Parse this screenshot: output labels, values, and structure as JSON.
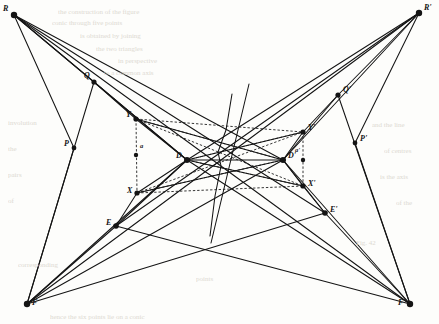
{
  "figure": {
    "type": "geometric-construction-diagram",
    "background_color": "#fdfdfb",
    "ink_color": "#141414",
    "width": 439,
    "height": 324
  },
  "points": [
    {
      "id": "R",
      "label": "R",
      "x": 14,
      "y": 15,
      "label_dx": -11,
      "label_dy": -4,
      "dot": 3.2
    },
    {
      "id": "Rp",
      "label": "R'",
      "x": 419,
      "y": 13,
      "label_dx": 5,
      "label_dy": -3,
      "dot": 3.2
    },
    {
      "id": "F",
      "label": "F",
      "x": 27,
      "y": 304,
      "label_dx": 5,
      "label_dy": 1,
      "dot": 3.2
    },
    {
      "id": "Fp",
      "label": "F'",
      "x": 410,
      "y": 304,
      "label_dx": -12,
      "label_dy": 1,
      "dot": 3.2
    },
    {
      "id": "Q",
      "label": "Q",
      "x": 94,
      "y": 82,
      "label_dx": -10,
      "label_dy": -4,
      "dot": 2.6
    },
    {
      "id": "Qp",
      "label": "Q'",
      "x": 338,
      "y": 95,
      "label_dx": 5,
      "label_dy": -3,
      "dot": 2.6
    },
    {
      "id": "P",
      "label": "P",
      "x": 74,
      "y": 148,
      "label_dx": -10,
      "label_dy": -2,
      "dot": 2.4
    },
    {
      "id": "Pp",
      "label": "P'",
      "x": 355,
      "y": 143,
      "label_dx": 5,
      "label_dy": -2,
      "dot": 2.4
    },
    {
      "id": "E",
      "label": "E",
      "x": 116,
      "y": 226,
      "label_dx": -10,
      "label_dy": -1,
      "dot": 2.8
    },
    {
      "id": "Ep",
      "label": "E'",
      "x": 325,
      "y": 213,
      "label_dx": 5,
      "label_dy": -1,
      "dot": 2.8
    },
    {
      "id": "D",
      "label": "D",
      "x": 187,
      "y": 160,
      "label_dx": -11,
      "label_dy": -2,
      "dot": 3.0
    },
    {
      "id": "Dp",
      "label": "D'",
      "x": 283,
      "y": 160,
      "label_dx": 5,
      "label_dy": -2,
      "dot": 3.0
    },
    {
      "id": "Y",
      "label": "Y",
      "x": 136,
      "y": 119,
      "label_dx": -10,
      "label_dy": -2,
      "dot": 2.6
    },
    {
      "id": "Yp",
      "label": "Y'",
      "x": 303,
      "y": 132,
      "label_dx": 5,
      "label_dy": -2,
      "dot": 2.6
    },
    {
      "id": "X",
      "label": "X",
      "x": 137,
      "y": 193,
      "label_dx": -10,
      "label_dy": 0,
      "dot": 2.6
    },
    {
      "id": "Xp",
      "label": "X'",
      "x": 303,
      "y": 186,
      "label_dx": 5,
      "label_dy": 0,
      "dot": 2.6
    },
    {
      "id": "a",
      "label": "a",
      "x": 136,
      "y": 155,
      "label_dx": 4,
      "label_dy": -6,
      "dot": 2.2
    },
    {
      "id": "ap",
      "label": "a'",
      "x": 303,
      "y": 160,
      "label_dx": -8,
      "label_dy": -7,
      "dot": 2.2
    }
  ],
  "solid_edges": [
    [
      "R",
      "Q"
    ],
    [
      "R",
      "P"
    ],
    [
      "R",
      "D"
    ],
    [
      "R",
      "Dp"
    ],
    [
      "R",
      "Ep"
    ],
    [
      "R",
      "Fp"
    ],
    [
      "Rp",
      "Qp"
    ],
    [
      "Rp",
      "Pp"
    ],
    [
      "Rp",
      "Dp"
    ],
    [
      "Rp",
      "D"
    ],
    [
      "Rp",
      "E"
    ],
    [
      "Rp",
      "F"
    ],
    [
      "F",
      "E"
    ],
    [
      "F",
      "P"
    ],
    [
      "F",
      "Q"
    ],
    [
      "F",
      "D"
    ],
    [
      "F",
      "Dp"
    ],
    [
      "F",
      "Ep"
    ],
    [
      "Fp",
      "Ep"
    ],
    [
      "Fp",
      "Pp"
    ],
    [
      "Fp",
      "Qp"
    ],
    [
      "Fp",
      "Dp"
    ],
    [
      "Fp",
      "D"
    ],
    [
      "Fp",
      "E"
    ],
    [
      "Q",
      "Y"
    ],
    [
      "Q",
      "D"
    ],
    [
      "Qp",
      "Yp"
    ],
    [
      "Qp",
      "Dp"
    ],
    [
      "E",
      "X"
    ],
    [
      "E",
      "D"
    ],
    [
      "Ep",
      "Xp"
    ],
    [
      "Ep",
      "Dp"
    ],
    [
      "D",
      "Y"
    ],
    [
      "D",
      "X"
    ],
    [
      "Dp",
      "Yp"
    ],
    [
      "Dp",
      "Xp"
    ],
    [
      "D",
      "Dp"
    ],
    [
      "D",
      "Yp"
    ],
    [
      "D",
      "Xp"
    ],
    [
      "Dp",
      "Y"
    ],
    [
      "Dp",
      "X"
    ]
  ],
  "dashed_edges": [
    [
      "Y",
      "X"
    ],
    [
      "Yp",
      "Xp"
    ],
    [
      "Y",
      "Yp"
    ],
    [
      "X",
      "Xp"
    ],
    [
      "Y",
      "Xp"
    ],
    [
      "X",
      "Yp"
    ],
    [
      "Y",
      "Dp"
    ],
    [
      "X",
      "Dp"
    ],
    [
      "Yp",
      "D"
    ],
    [
      "Xp",
      "D"
    ]
  ],
  "extra_lines": [
    {
      "name": "steep-axis-line",
      "x1": 249,
      "y1": 84,
      "x2": 211,
      "y2": 243
    },
    {
      "name": "curved-median-line",
      "points": "232,94 226,130 218,152 221,166 215,196 210,236"
    }
  ],
  "bleed_text": [
    {
      "text": "the construction of the figure",
      "x": 58,
      "y": 9,
      "size": 7
    },
    {
      "text": "conic through five points",
      "x": 52,
      "y": 20,
      "size": 7
    },
    {
      "text": "is obtained by joining",
      "x": 80,
      "y": 33,
      "size": 7
    },
    {
      "text": "the two triangles",
      "x": 96,
      "y": 46,
      "size": 7
    },
    {
      "text": "in perspective",
      "x": 118,
      "y": 58,
      "size": 7
    },
    {
      "text": "to a common axis",
      "x": 104,
      "y": 70,
      "size": 7
    },
    {
      "text": "involution",
      "x": 8,
      "y": 120,
      "size": 7
    },
    {
      "text": "the",
      "x": 8,
      "y": 146,
      "size": 7
    },
    {
      "text": "pairs",
      "x": 8,
      "y": 172,
      "size": 7
    },
    {
      "text": "of",
      "x": 8,
      "y": 198,
      "size": 7
    },
    {
      "text": "corresponding",
      "x": 18,
      "y": 262,
      "size": 7
    },
    {
      "text": "points",
      "x": 196,
      "y": 276,
      "size": 7
    },
    {
      "text": "Fig. 42",
      "x": 356,
      "y": 240,
      "size": 7
    },
    {
      "text": "and the line",
      "x": 372,
      "y": 122,
      "size": 7
    },
    {
      "text": "of centres",
      "x": 384,
      "y": 148,
      "size": 7
    },
    {
      "text": "is the axis",
      "x": 380,
      "y": 174,
      "size": 7
    },
    {
      "text": "of the",
      "x": 396,
      "y": 200,
      "size": 7
    },
    {
      "text": "hence the six points lie on a conic",
      "x": 50,
      "y": 314,
      "size": 7
    }
  ]
}
